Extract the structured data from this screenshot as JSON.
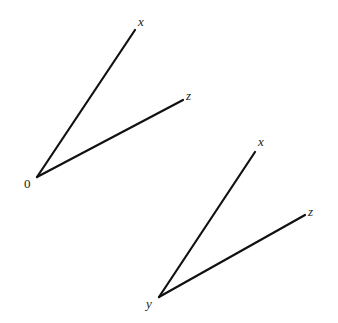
{
  "diagram": {
    "line_color": "#111111",
    "label_color": "#222222",
    "figures": [
      {
        "name": "figure-1",
        "origin": {
          "x": 37,
          "y": 177,
          "label": "0",
          "label_x": 24,
          "label_y": 188
        },
        "axes": [
          {
            "name": "x",
            "label": "x",
            "end_x": 135,
            "end_y": 30,
            "label_x": 138,
            "label_y": 26
          },
          {
            "name": "z",
            "label": "z",
            "end_x": 183,
            "end_y": 100,
            "label_x": 186,
            "label_y": 100
          }
        ]
      },
      {
        "name": "figure-2",
        "origin": {
          "x": 159,
          "y": 297,
          "label": "y",
          "label_x": 146,
          "label_y": 308
        },
        "axes": [
          {
            "name": "x",
            "label": "x",
            "end_x": 255,
            "end_y": 152,
            "label_x": 258,
            "label_y": 146
          },
          {
            "name": "z",
            "label": "z",
            "end_x": 305,
            "end_y": 215,
            "label_x": 308,
            "label_y": 216
          }
        ]
      }
    ]
  }
}
